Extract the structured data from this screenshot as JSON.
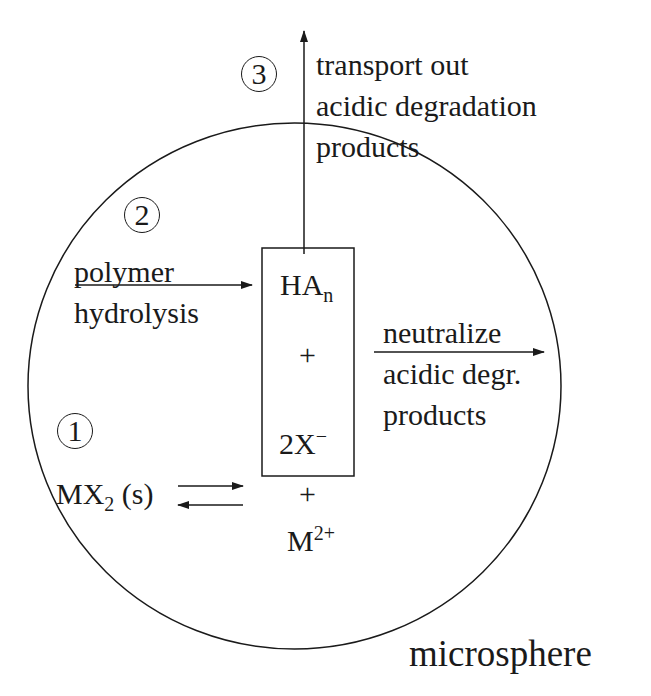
{
  "diagram": {
    "container_label": "microsphere",
    "steps": [
      {
        "number": "1",
        "label_formula": "MX",
        "label_sub": "2",
        "label_suffix": " (s)"
      },
      {
        "number": "2",
        "label_lines": [
          "polymer",
          "hydrolysis"
        ]
      },
      {
        "number": "3",
        "label_lines": [
          "transport out",
          "acidic degradation",
          "products"
        ]
      }
    ],
    "box": {
      "species": [
        {
          "text": "HA",
          "sub": "n"
        },
        {
          "text": "+"
        },
        {
          "text": "2X",
          "sup": "−"
        }
      ]
    },
    "below_box": {
      "plus": "+",
      "ion": "M",
      "ion_sup": "2+"
    },
    "neutralize": {
      "label_lines": [
        "neutralize",
        "acidic degr.",
        "products"
      ]
    },
    "colors": {
      "line": "#1a1a1a",
      "background": "#ffffff"
    }
  }
}
